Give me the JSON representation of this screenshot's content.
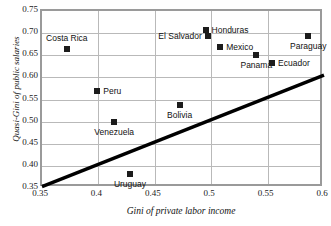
{
  "chart_data": {
    "type": "scatter",
    "title": "",
    "xlabel": "Gini of private labor income",
    "ylabel": "Quasi-Gini of public salaries",
    "xlim": [
      0.35,
      0.6
    ],
    "ylim": [
      0.35,
      0.75
    ],
    "xticks": [
      "0.35",
      "0.4",
      "0.45",
      "0.5",
      "0.55",
      "0.6"
    ],
    "yticks": [
      "0.35",
      "0.40",
      "0.45",
      "0.50",
      "0.55",
      "0.60",
      "0.65",
      "0.70",
      "0.75"
    ],
    "grid": true,
    "legend": "none",
    "points": [
      {
        "label": "Costa Rica",
        "x": 0.372,
        "y": 0.665,
        "label_pos": "above"
      },
      {
        "label": "Honduras",
        "x": 0.495,
        "y": 0.708,
        "label_pos": "right"
      },
      {
        "label": "El Salvador",
        "x": 0.497,
        "y": 0.693,
        "label_pos": "left"
      },
      {
        "label": "Mexico",
        "x": 0.508,
        "y": 0.669,
        "label_pos": "right"
      },
      {
        "label": "Paraguay",
        "x": 0.586,
        "y": 0.693,
        "label_pos": "below"
      },
      {
        "label": "Panama",
        "x": 0.54,
        "y": 0.65,
        "label_pos": "below"
      },
      {
        "label": "Ecuador",
        "x": 0.554,
        "y": 0.633,
        "label_pos": "right"
      },
      {
        "label": "Peru",
        "x": 0.399,
        "y": 0.569,
        "label_pos": "right"
      },
      {
        "label": "Bolivia",
        "x": 0.472,
        "y": 0.537,
        "label_pos": "below"
      },
      {
        "label": "Venezuela",
        "x": 0.414,
        "y": 0.499,
        "label_pos": "below"
      },
      {
        "label": "Uruguay",
        "x": 0.428,
        "y": 0.382,
        "label_pos": "below"
      }
    ],
    "trendline": {
      "x0": 0.35,
      "y0": 0.353,
      "x1": 0.6,
      "y1": 0.605
    },
    "colors": {
      "marker": "#1c1c1c",
      "trendline": "#000000",
      "gridline": "#b9b9b9",
      "frame": "#9a9a9a",
      "text": "#111111"
    }
  }
}
